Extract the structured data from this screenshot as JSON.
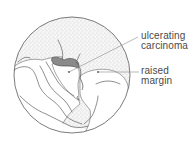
{
  "figure": {
    "colors": {
      "outline": "#5a5a5a",
      "stipple": "#bdbdbd",
      "lesion": "#7a7a7a",
      "text": "#4a4a4a",
      "background": "#ffffff"
    }
  },
  "labels": {
    "ulcerating_carcinoma": {
      "line1": "ulcerating",
      "line2": "carcinoma"
    },
    "raised_margin": {
      "line1": "raised",
      "line2": "margin"
    }
  }
}
